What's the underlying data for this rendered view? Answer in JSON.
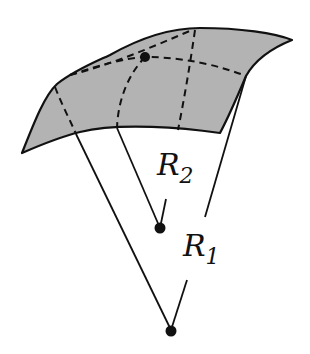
{
  "diagram": {
    "labels": {
      "r2_main": "R",
      "r2_sub": "2",
      "r1_main": "R",
      "r1_sub": "1"
    },
    "colors": {
      "surface_fill": "#b3b3b3",
      "stroke": "#111111"
    }
  }
}
